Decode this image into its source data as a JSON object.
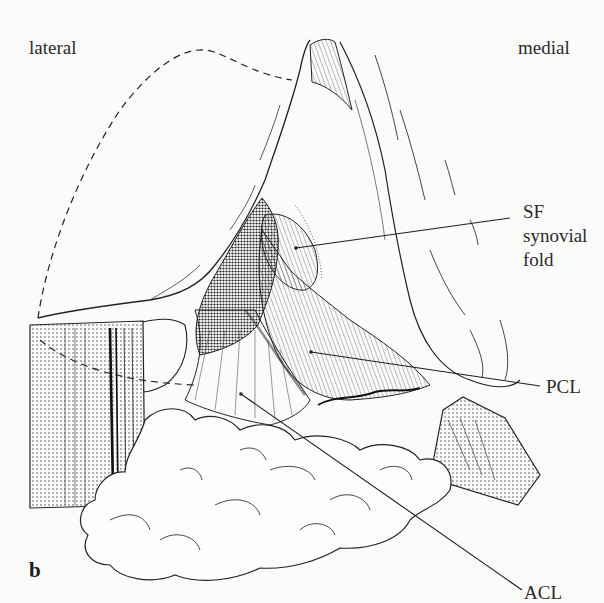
{
  "figure": {
    "panel_letter": "b",
    "orientation": {
      "left": "lateral",
      "right": "medial"
    },
    "labels": {
      "sf": {
        "abbr": "SF",
        "line1": "synovial",
        "line2": "fold"
      },
      "pcl": {
        "abbr": "PCL"
      },
      "acl": {
        "abbr": "ACL"
      }
    },
    "leaders": [
      {
        "name": "sf-leader",
        "x1": 296,
        "y1": 248,
        "x2": 510,
        "y2": 218
      },
      {
        "name": "pcl-leader",
        "x1": 311,
        "y1": 352,
        "x2": 540,
        "y2": 386
      },
      {
        "name": "acl-leader",
        "x1": 241,
        "y1": 394,
        "x2": 522,
        "y2": 590
      }
    ],
    "colors": {
      "ink": "#1e1e1e",
      "paper": "#fbfbfa"
    }
  }
}
